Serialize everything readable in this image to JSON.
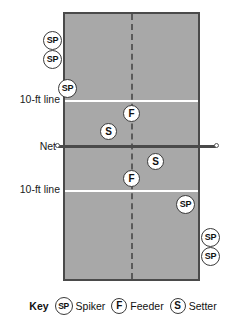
{
  "diagram": {
    "court": {
      "fill_color": "#a8a8a8",
      "border_color": "#4a4a4a",
      "line_color": "#ffffff",
      "center_line_style": "dashed"
    },
    "side_labels": [
      {
        "id": "ten-ft-line-top",
        "text": "10-ft line"
      },
      {
        "id": "net",
        "text": "Net"
      },
      {
        "id": "ten-ft-line-bottom",
        "text": "10-ft line"
      }
    ],
    "markers": [
      {
        "id": "spiker-left-1",
        "role": "SP",
        "label": "SP",
        "x": 43,
        "y": 31,
        "location": "off-court left, top"
      },
      {
        "id": "spiker-left-2",
        "role": "SP",
        "label": "SP",
        "x": 43,
        "y": 50,
        "location": "off-court left, top"
      },
      {
        "id": "spiker-left-3",
        "role": "SP",
        "label": "SP",
        "x": 58,
        "y": 79,
        "location": "on-court left, front"
      },
      {
        "id": "feeder-top",
        "role": "F",
        "label": "F",
        "x": 123,
        "y": 105,
        "location": "center line, above net"
      },
      {
        "id": "setter-top",
        "role": "S",
        "label": "S",
        "x": 100,
        "y": 123,
        "location": "left of center, above net"
      },
      {
        "id": "setter-bottom",
        "role": "S",
        "label": "S",
        "x": 147,
        "y": 153,
        "location": "right of center, below net"
      },
      {
        "id": "feeder-bottom",
        "role": "F",
        "label": "F",
        "x": 123,
        "y": 170,
        "location": "center line, below net"
      },
      {
        "id": "spiker-right-1",
        "role": "SP",
        "label": "SP",
        "x": 176,
        "y": 195,
        "location": "on-court right, back"
      },
      {
        "id": "spiker-right-2",
        "role": "SP",
        "label": "SP",
        "x": 201,
        "y": 228,
        "location": "off-court right, bottom"
      },
      {
        "id": "spiker-right-3",
        "role": "SP",
        "label": "SP",
        "x": 201,
        "y": 247,
        "location": "off-court right, bottom"
      }
    ]
  },
  "key": {
    "title": "Key",
    "entries": [
      {
        "symbol": "SP",
        "label": "Spiker"
      },
      {
        "symbol": "F",
        "label": "Feeder"
      },
      {
        "symbol": "S",
        "label": "Setter"
      }
    ]
  }
}
